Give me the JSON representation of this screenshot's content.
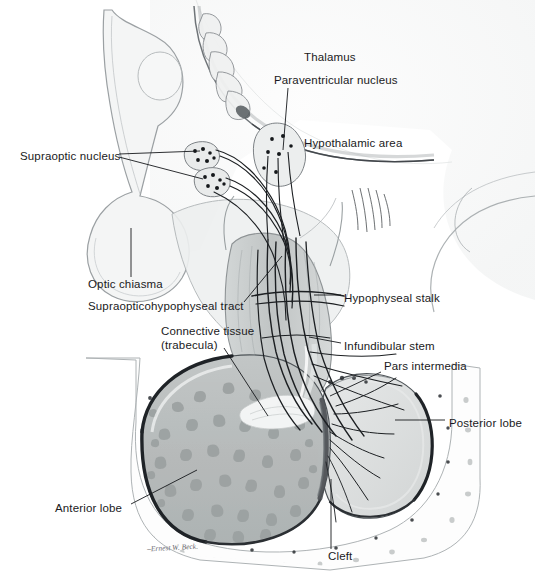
{
  "figure": {
    "signature": "–Ernest W. Beck.",
    "background_color": "#ffffff",
    "ink_color": "#1a1a22",
    "width": 535,
    "height": 583
  },
  "palette": {
    "outline": "#5a5f63",
    "outline_dark": "#23262a",
    "anterior_lobe_fill": "#b9bdbd",
    "anterior_lobe_speckle": "#9aa0a0",
    "posterior_lobe_fill": "#dde0e0",
    "stalk_fill": "#c6caca",
    "brain_fill": "#f2f3f3",
    "bone_fill": "#fdfdfd",
    "bone_cell": "#b4b8b8",
    "nerve_fiber": "#1c1f22",
    "cleft_color": "#4a4e52",
    "nucleus_fill": "#e8eaea",
    "nucleus_dot": "#15181b",
    "leader_line": "#16181c"
  },
  "labels": [
    {
      "id": "thalamus",
      "text": "Thalamus",
      "x": 304,
      "y": 58,
      "anchor": "start",
      "has_leader": false
    },
    {
      "id": "paraventricular-nucleus",
      "text": "Paraventricular nucleus",
      "x": 274,
      "y": 81,
      "anchor": "start",
      "has_leader": true,
      "leader": [
        [
          288,
          87
        ],
        [
          283,
          150
        ]
      ]
    },
    {
      "id": "hypothalamic-area",
      "text": "Hypothalamic area",
      "x": 304,
      "y": 144,
      "anchor": "start",
      "has_leader": false
    },
    {
      "id": "supraoptic-nucleus",
      "text": "Supraoptic nucleus",
      "x": 20,
      "y": 157,
      "anchor": "start",
      "has_leader": true,
      "leader": [
        [
          120,
          154
        ],
        [
          198,
          152
        ]
      ],
      "leader2": [
        [
          120,
          157
        ],
        [
          202,
          178
        ]
      ]
    },
    {
      "id": "optic-chiasma",
      "text": "Optic chiasma",
      "x": 88,
      "y": 285,
      "anchor": "start",
      "has_leader": true,
      "leader": [
        [
          131,
          276
        ],
        [
          131,
          230
        ]
      ]
    },
    {
      "id": "supraopticohypophyseal-tract",
      "text": "Supraopticohypophyseal tract",
      "x": 88,
      "y": 307,
      "anchor": "start",
      "has_leader": true,
      "leader": [
        [
          243,
          302
        ],
        [
          281,
          256
        ]
      ]
    },
    {
      "id": "connective-tissue",
      "text": "Connective tissue",
      "x": 161,
      "y": 332,
      "anchor": "start",
      "has_leader": false
    },
    {
      "id": "connective-tissue-trabecula",
      "text": "(trabecula)",
      "x": 161,
      "y": 346,
      "anchor": "start",
      "has_leader": true,
      "leader": [
        [
          222,
          348
        ],
        [
          268,
          415
        ]
      ]
    },
    {
      "id": "hypophyseal-stalk",
      "text": "Hypophyseal stalk",
      "x": 344,
      "y": 299,
      "anchor": "start",
      "has_leader": true,
      "leader": [
        [
          340,
          295
        ],
        [
          316,
          295
        ]
      ]
    },
    {
      "id": "infundibular-stem",
      "text": "Infundibular stem",
      "x": 344,
      "y": 347,
      "anchor": "start",
      "has_leader": true,
      "leader": [
        [
          340,
          343
        ],
        [
          310,
          337
        ]
      ]
    },
    {
      "id": "pars-intermedia",
      "text": "Pars intermedia",
      "x": 384,
      "y": 367,
      "anchor": "start",
      "has_leader": true,
      "leader": [
        [
          380,
          372
        ],
        [
          330,
          395
        ]
      ]
    },
    {
      "id": "posterior-lobe",
      "text": "Posterior lobe",
      "x": 449,
      "y": 424,
      "anchor": "start",
      "has_leader": true,
      "leader": [
        [
          444,
          420
        ],
        [
          396,
          420
        ]
      ]
    },
    {
      "id": "anterior-lobe",
      "text": "Anterior lobe",
      "x": 55,
      "y": 509,
      "anchor": "start",
      "has_leader": true,
      "leader": [
        [
          130,
          503
        ],
        [
          196,
          470
        ]
      ]
    },
    {
      "id": "cleft",
      "text": "Cleft",
      "x": 328,
      "y": 557,
      "anchor": "start",
      "has_leader": true,
      "leader": [
        [
          331,
          548
        ],
        [
          331,
          480
        ]
      ]
    }
  ],
  "structures": [
    {
      "id": "thalamus-arc",
      "name": "thalamus",
      "kind": "arc-outline"
    },
    {
      "id": "optic-chiasma-body",
      "name": "optic chiasma",
      "kind": "oval"
    },
    {
      "id": "paraventricular-nucleus-body",
      "name": "paraventricular nucleus",
      "kind": "blob",
      "dot_count": 7
    },
    {
      "id": "supraoptic-nucleus-upper",
      "name": "supraoptic nucleus (upper)",
      "kind": "blob",
      "dot_count": 6
    },
    {
      "id": "supraoptic-nucleus-lower",
      "name": "supraoptic nucleus (lower)",
      "kind": "blob",
      "dot_count": 6
    },
    {
      "id": "hypophyseal-stalk-body",
      "name": "hypophyseal stalk",
      "kind": "column"
    },
    {
      "id": "anterior-lobe-body",
      "name": "anterior lobe",
      "kind": "lobe",
      "speckle_count": 90
    },
    {
      "id": "posterior-lobe-body",
      "name": "posterior lobe",
      "kind": "lobe"
    },
    {
      "id": "pars-intermedia-band",
      "name": "pars intermedia",
      "kind": "band"
    },
    {
      "id": "cleft-line",
      "name": "cleft",
      "kind": "slit"
    },
    {
      "id": "sella-turcica-bone",
      "name": "sella turcica bone",
      "kind": "bone",
      "cell_count": 40
    },
    {
      "id": "nerve-fiber-bundle",
      "name": "supraopticohypophyseal tract fibers",
      "kind": "fiber-bundle",
      "fiber_count": 22
    }
  ]
}
